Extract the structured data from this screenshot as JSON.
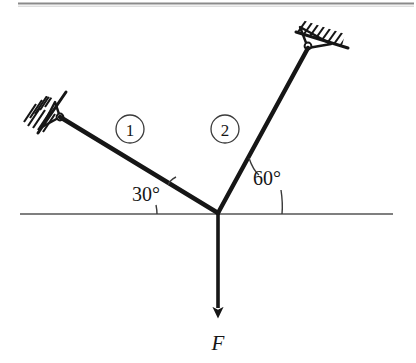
{
  "figure": {
    "kind": "statics-free-body-diagram",
    "background_color": "#ffffff",
    "ink_color": "#161616",
    "rule_color": "#8a8a8a",
    "top_rule": {
      "name": "top-border-rule",
      "x1": 18,
      "x2": 414,
      "y": 3
    },
    "ground_line": {
      "name": "horizontal-reference-line",
      "x1": 20,
      "x2": 393,
      "y": 214,
      "color": "#555555"
    },
    "joint": {
      "name": "joint-node",
      "x": 218,
      "y": 213
    },
    "members": [
      {
        "id": "1",
        "label": "1",
        "name": "member-1",
        "x1": 60,
        "y1": 117,
        "x2": 218,
        "y2": 213,
        "angle_deg": 30,
        "label_circle": {
          "cx": 130,
          "cy": 129,
          "r": 14
        }
      },
      {
        "id": "2",
        "label": "2",
        "name": "member-2",
        "x1": 218,
        "y1": 213,
        "x2": 308,
        "y2": 48,
        "angle_deg": 60,
        "label_circle": {
          "cx": 225,
          "cy": 129,
          "r": 14
        }
      }
    ],
    "supports": [
      {
        "name": "pin-support-left",
        "pin_x": 60,
        "pin_y": 117,
        "wall_angle_deg": 58,
        "hatch_count": 7
      },
      {
        "name": "pin-support-right",
        "pin_x": 308,
        "pin_y": 48,
        "wall_angle_deg": 18,
        "hatch_count": 8
      }
    ],
    "angles": [
      {
        "name": "angle-30",
        "label": "30°",
        "value": 30,
        "unit": "degrees",
        "label_x": 146,
        "label_y": 201,
        "between": [
          "member-1",
          "horizontal-reference-line"
        ]
      },
      {
        "name": "angle-60",
        "label": "60°",
        "value": 60,
        "unit": "degrees",
        "label_x": 253,
        "label_y": 185,
        "between": [
          "member-2",
          "horizontal-reference-line"
        ]
      }
    ],
    "force": {
      "name": "applied-force-F",
      "label": "F",
      "direction": "downward",
      "x": 218,
      "y_start": 213,
      "y_end": 322,
      "label_x": 218,
      "label_y": 347
    }
  }
}
